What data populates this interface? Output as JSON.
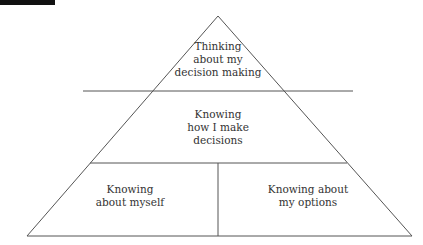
{
  "diagram": {
    "type": "pyramid",
    "levels": [
      {
        "label": "Thinking\nabout my\ndecision making"
      },
      {
        "label": "Knowing\nhow I make\ndecisions"
      },
      {
        "base_left": "Knowing\nabout myself",
        "base_right": "Knowing about\nmy options"
      }
    ]
  },
  "labels": {
    "top": "Thinking\nabout my\ndecision making",
    "middle": "Knowing\nhow I make\ndecisions",
    "bottom_left": "Knowing\nabout myself",
    "bottom_right": "Knowing about\nmy options"
  }
}
